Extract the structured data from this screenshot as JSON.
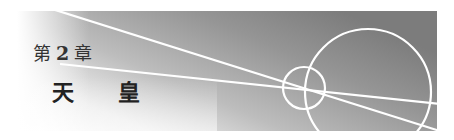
{
  "chapter": {
    "prefix": "第",
    "number": "2",
    "suffix": "章",
    "title_char_1": "天",
    "title_char_2": "皇"
  },
  "colors": {
    "panel_dark": "#7a7a7a",
    "panel_mid": "#b0b0b0",
    "panel_light": "#f4f4f4",
    "line": "#ffffff",
    "text": "#2a2a2a"
  }
}
